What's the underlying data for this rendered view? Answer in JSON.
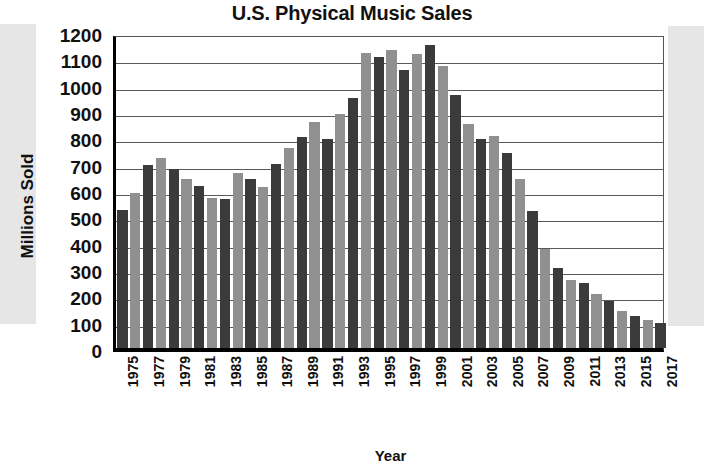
{
  "chart_data": {
    "type": "bar",
    "title": "U.S. Physical Music Sales",
    "xlabel": "Year",
    "ylabel": "Millions Sold",
    "ylim": [
      0,
      1200
    ],
    "ytick_step": 100,
    "grid": true,
    "legend": "none",
    "colors": {
      "bar_dark": "#3b3b3b",
      "bar_light": "#909090",
      "axis": "#000000",
      "gridline": "#5a5a5a",
      "background": "#ffffff",
      "scan_band": "#e6e6e6"
    },
    "yticks": [
      1200,
      1100,
      1000,
      900,
      800,
      700,
      600,
      500,
      400,
      300,
      200,
      100,
      0
    ],
    "xtick_labels": [
      "1975",
      "1977",
      "1979",
      "1981",
      "1983",
      "1985",
      "1987",
      "1989",
      "1991",
      "1993",
      "1995",
      "1997",
      "1999",
      "2001",
      "2003",
      "2005",
      "2007",
      "2009",
      "2011",
      "2013",
      "2015",
      "2017"
    ],
    "categories": [
      "1975",
      "1976",
      "1977",
      "1978",
      "1979",
      "1980",
      "1981",
      "1982",
      "1983",
      "1984",
      "1985",
      "1986",
      "1987",
      "1988",
      "1989",
      "1990",
      "1991",
      "1992",
      "1993",
      "1994",
      "1995",
      "1996",
      "1997",
      "1998",
      "1999",
      "2000",
      "2001",
      "2002",
      "2003",
      "2004",
      "2005",
      "2006",
      "2007",
      "2008",
      "2009",
      "2010",
      "2011",
      "2012",
      "2013",
      "2014",
      "2015",
      "2016",
      "2017"
    ],
    "values": [
      525,
      590,
      695,
      720,
      680,
      640,
      615,
      570,
      565,
      665,
      640,
      610,
      700,
      760,
      800,
      860,
      795,
      890,
      950,
      1120,
      1105,
      1130,
      1055,
      1115,
      1150,
      1070,
      960,
      850,
      795,
      805,
      740,
      640,
      520,
      375,
      305,
      260,
      245,
      205,
      180,
      140,
      120,
      105,
      95
    ]
  }
}
